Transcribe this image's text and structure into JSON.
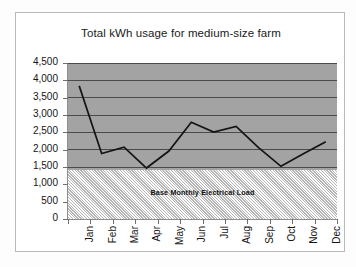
{
  "chart_data": {
    "type": "line",
    "title": "Total kWh usage for medium-size farm",
    "xlabel": "",
    "ylabel": "",
    "categories": [
      "Jan",
      "Feb",
      "Mar",
      "Apr",
      "May",
      "Jun",
      "Jul",
      "Aug",
      "Sep",
      "Oct",
      "Nov",
      "Dec"
    ],
    "series": [
      {
        "name": "Total kWh usage",
        "values": [
          3840,
          1890,
          2070,
          1470,
          1960,
          2790,
          2510,
          2670,
          2060,
          1520,
          1880,
          2230
        ]
      }
    ],
    "ylim": [
      0,
      4500
    ],
    "ytick_step": 500,
    "ytick_labels": [
      "4,500",
      "4,000",
      "3,500",
      "3,000",
      "2,500",
      "2,000",
      "1,500",
      "1,000",
      "500",
      "0"
    ],
    "ytick_values": [
      4500,
      4000,
      3500,
      3000,
      2500,
      2000,
      1500,
      1000,
      500,
      0
    ],
    "grid": true,
    "legend": "none",
    "annotations": [
      {
        "text": "Base Monthly Electrical Load",
        "region_top_value": 1400,
        "region_bottom_value": 0,
        "style": "hatched-band"
      }
    ],
    "colors": {
      "plot_background": "#a3a3a3",
      "base_band": "#dcdcdc",
      "gridline": "#4a4a4a",
      "series_line": "#141414",
      "axis": "#8d8d8d",
      "text": "#151515",
      "card_background": "#ffffff",
      "card_border": "#b9b9b9"
    }
  }
}
